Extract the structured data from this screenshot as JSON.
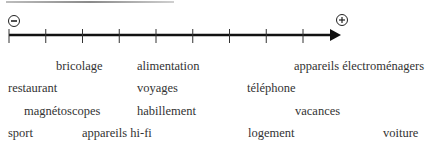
{
  "scale": {
    "minus_label": "−",
    "plus_label": "+",
    "tick_count": 9
  },
  "words": [
    {
      "text": "bricolage",
      "x": 56,
      "y": 59
    },
    {
      "text": "alimentation",
      "x": 137,
      "y": 59
    },
    {
      "text": "appareils électroménagers",
      "x": 294,
      "y": 59
    },
    {
      "text": "restaurant",
      "x": 8,
      "y": 81
    },
    {
      "text": "voyages",
      "x": 137,
      "y": 81
    },
    {
      "text": "téléphone",
      "x": 247,
      "y": 81
    },
    {
      "text": "magnétoscopes",
      "x": 24,
      "y": 104
    },
    {
      "text": "habillement",
      "x": 137,
      "y": 104
    },
    {
      "text": "vacances",
      "x": 295,
      "y": 104
    },
    {
      "text": "sport",
      "x": 8,
      "y": 126
    },
    {
      "text": "appareils hi-fi",
      "x": 82,
      "y": 126
    },
    {
      "text": "logement",
      "x": 248,
      "y": 126
    },
    {
      "text": "voiture",
      "x": 383,
      "y": 126
    }
  ]
}
